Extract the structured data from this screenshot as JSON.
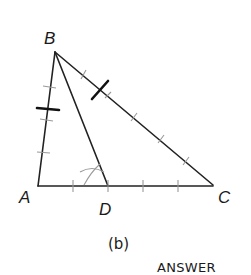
{
  "figure": {
    "caption": "(b)",
    "footer": "ANSWER"
  },
  "vertices": {
    "A": {
      "label": "A",
      "x": 38,
      "y": 186
    },
    "B": {
      "label": "B",
      "x": 55,
      "y": 52
    },
    "C": {
      "label": "C",
      "x": 213,
      "y": 185
    },
    "D": {
      "label": "D",
      "x": 108,
      "y": 186
    }
  },
  "segments": [
    {
      "name": "AB",
      "from": "A",
      "to": "B"
    },
    {
      "name": "BC",
      "from": "B",
      "to": "C"
    },
    {
      "name": "AC",
      "from": "A",
      "to": "C"
    },
    {
      "name": "BD",
      "from": "B",
      "to": "D",
      "note": "angle bisector"
    }
  ],
  "construction": {
    "description": "Angle bisector of angle B constructed with compass arcs; equal-length marks on BA and BC",
    "arc_intersection": {
      "x": 93,
      "y": 176
    }
  },
  "colors": {
    "line": "#222222",
    "construction_marks": "#999999",
    "bold_marks": "#111111",
    "background": "#ffffff"
  }
}
